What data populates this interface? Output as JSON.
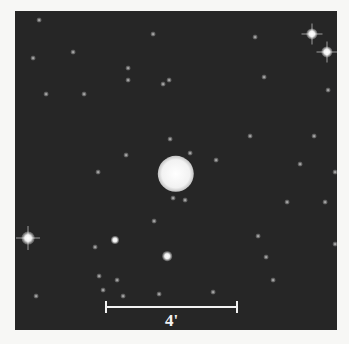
{
  "image": {
    "type": "astronomical-survey-image",
    "subject": "planetary-nebula-field",
    "panel": {
      "left": 15,
      "top": 11,
      "width": 322,
      "height": 319,
      "background": "#262626"
    },
    "central_object": {
      "x": 176,
      "y": 174,
      "diameter": 27
    }
  },
  "scale_bar": {
    "label": "4'",
    "x1": 106,
    "x2": 237,
    "y": 307,
    "tick_height": 12,
    "color": "#f2f2f2"
  },
  "bright_stars": [
    {
      "x": 312,
      "y": 34,
      "size": 7,
      "spikes": true
    },
    {
      "x": 327,
      "y": 52,
      "size": 7,
      "spikes": true
    },
    {
      "x": 28,
      "y": 238,
      "size": 8,
      "spikes": true
    },
    {
      "x": 167,
      "y": 256,
      "size": 6,
      "spikes": false
    },
    {
      "x": 115,
      "y": 240,
      "size": 5,
      "spikes": false
    }
  ],
  "faint_stars": [
    {
      "x": 39,
      "y": 20
    },
    {
      "x": 153,
      "y": 34
    },
    {
      "x": 255,
      "y": 37
    },
    {
      "x": 73,
      "y": 52
    },
    {
      "x": 33,
      "y": 58
    },
    {
      "x": 128,
      "y": 68
    },
    {
      "x": 169,
      "y": 80
    },
    {
      "x": 128,
      "y": 80
    },
    {
      "x": 163,
      "y": 84
    },
    {
      "x": 264,
      "y": 77
    },
    {
      "x": 46,
      "y": 94
    },
    {
      "x": 84,
      "y": 94
    },
    {
      "x": 328,
      "y": 90
    },
    {
      "x": 170,
      "y": 139
    },
    {
      "x": 126,
      "y": 155
    },
    {
      "x": 190,
      "y": 153
    },
    {
      "x": 250,
      "y": 136
    },
    {
      "x": 314,
      "y": 136
    },
    {
      "x": 216,
      "y": 160
    },
    {
      "x": 98,
      "y": 172
    },
    {
      "x": 300,
      "y": 164
    },
    {
      "x": 335,
      "y": 172
    },
    {
      "x": 173,
      "y": 198
    },
    {
      "x": 185,
      "y": 200
    },
    {
      "x": 325,
      "y": 202
    },
    {
      "x": 287,
      "y": 202
    },
    {
      "x": 154,
      "y": 221
    },
    {
      "x": 95,
      "y": 247
    },
    {
      "x": 258,
      "y": 236
    },
    {
      "x": 335,
      "y": 244
    },
    {
      "x": 99,
      "y": 276
    },
    {
      "x": 117,
      "y": 280
    },
    {
      "x": 103,
      "y": 290
    },
    {
      "x": 123,
      "y": 296
    },
    {
      "x": 159,
      "y": 294
    },
    {
      "x": 266,
      "y": 257
    },
    {
      "x": 273,
      "y": 280
    },
    {
      "x": 36,
      "y": 296
    },
    {
      "x": 213,
      "y": 292
    }
  ]
}
